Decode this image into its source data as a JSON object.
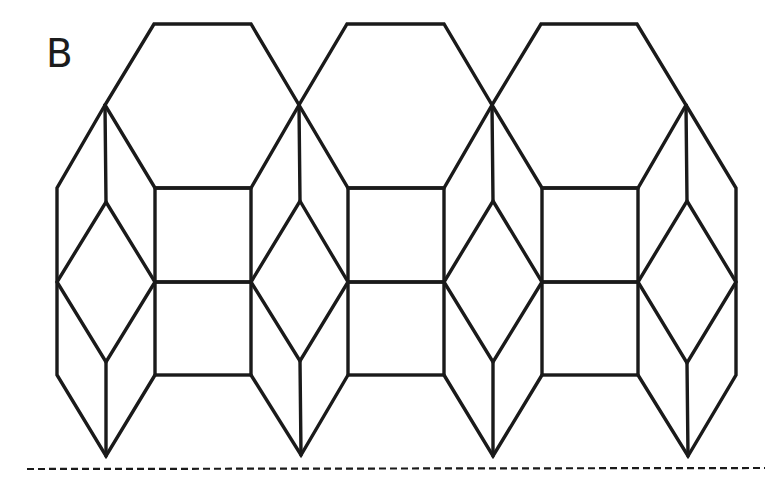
{
  "figure": {
    "panel_label": "B",
    "colors": {
      "line": "#1a1a1a",
      "background": "#ffffff"
    },
    "units": [
      {
        "hex_top": [
          [
            154,
            24
          ],
          [
            251,
            24
          ]
        ],
        "shoulders": [
          [
            105,
            105
          ],
          [
            299,
            105
          ]
        ],
        "square_x": [
          155,
          251
        ]
      },
      {
        "hex_top": [
          [
            347,
            24
          ],
          [
            444,
            24
          ]
        ],
        "shoulders": [
          [
            299,
            105
          ],
          [
            492,
            105
          ]
        ],
        "square_x": [
          348,
          444
        ]
      },
      {
        "hex_top": [
          [
            541,
            24
          ],
          [
            637,
            24
          ]
        ],
        "shoulders": [
          [
            492,
            105
          ],
          [
            686,
            105
          ]
        ],
        "square_x": [
          543,
          638
        ]
      }
    ],
    "rows_y": {
      "hex_top": 24,
      "shoulder": 105,
      "square_top": 188,
      "middle": 282,
      "square_bottom": 375,
      "point": 456
    },
    "columns_x": [
      57,
      106,
      155,
      251,
      300,
      348,
      444,
      493,
      542,
      638,
      687,
      736
    ],
    "fold_line": {
      "x1": 27,
      "x2": 765,
      "y": 469,
      "style": "dashed"
    }
  }
}
